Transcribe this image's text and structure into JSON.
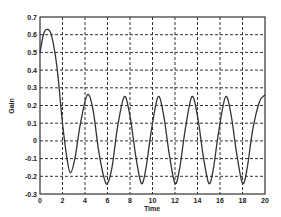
{
  "chart_data": {
    "type": "line",
    "title": "",
    "xlabel": "Time",
    "ylabel": "Gain",
    "xlim": [
      0,
      20
    ],
    "ylim": [
      -0.3,
      0.7
    ],
    "grid": true,
    "grid_style": "dashed",
    "legend": null,
    "x_ticks": [
      "0",
      "2",
      "4",
      "6",
      "8",
      "10",
      "12",
      "14",
      "16",
      "18",
      "20"
    ],
    "y_ticks": [
      "0.7",
      "0.6",
      "0.5",
      "0.4",
      "0.3",
      "0.2",
      "0.1",
      "0",
      "-0.1",
      "-0.2",
      "-0.3"
    ],
    "series": [
      {
        "name": "response",
        "color": "#333333",
        "x": [
          0,
          0.3,
          0.6,
          1.0,
          1.5,
          2.0,
          2.4,
          2.7,
          3.1,
          3.6,
          4.2,
          4.7,
          5.2,
          5.7,
          6.0,
          6.4,
          6.9,
          7.5,
          8.0,
          8.5,
          9.0,
          9.4,
          9.9,
          10.5,
          11.0,
          11.5,
          12.0,
          12.4,
          12.9,
          13.5,
          14.0,
          14.5,
          15.0,
          15.4,
          15.9,
          16.5,
          17.0,
          17.5,
          18.0,
          18.4,
          18.9,
          19.5,
          20.0
        ],
        "y": [
          0.5,
          0.6,
          0.63,
          0.6,
          0.42,
          0.1,
          -0.1,
          -0.18,
          -0.1,
          0.1,
          0.26,
          0.18,
          -0.05,
          -0.21,
          -0.24,
          -0.15,
          0.08,
          0.25,
          0.14,
          -0.08,
          -0.24,
          -0.16,
          0.06,
          0.25,
          0.14,
          -0.08,
          -0.24,
          -0.16,
          0.06,
          0.25,
          0.14,
          -0.08,
          -0.24,
          -0.16,
          0.06,
          0.25,
          0.14,
          -0.08,
          -0.24,
          -0.16,
          0.06,
          0.22,
          0.26
        ]
      }
    ]
  }
}
